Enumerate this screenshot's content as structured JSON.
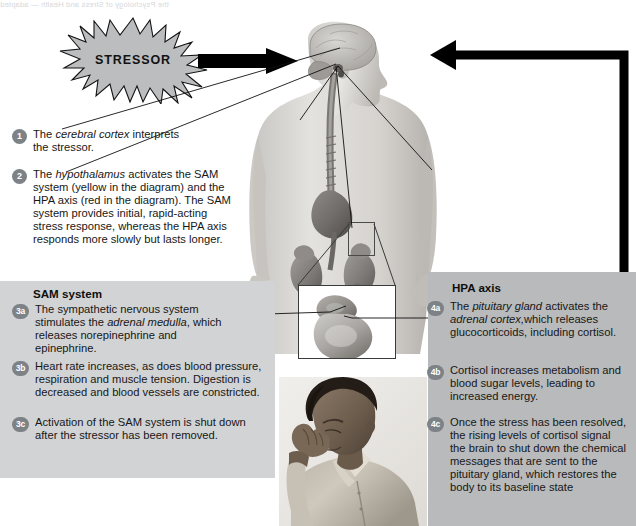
{
  "page": {
    "bleed_text": "the Psychology of Stress and Health — adapted",
    "width": 636,
    "height": 526,
    "background": "#ffffff"
  },
  "colors": {
    "badge": "#7d8287",
    "sam_panel": "#d2d3d4",
    "hpa_panel": "#b9babb",
    "burst_fill": "#bcbdbe",
    "arrow": "#000000",
    "text": "#171717"
  },
  "stressor": {
    "label": "STRESSOR",
    "shape": "starburst"
  },
  "steps": [
    {
      "id": "1",
      "badge": "1",
      "text_parts": [
        {
          "t": "The ",
          "i": false
        },
        {
          "t": "cerebral cortex",
          "i": true
        },
        {
          "t": " interprets the stressor.",
          "i": false
        }
      ]
    },
    {
      "id": "2",
      "badge": "2",
      "text_parts": [
        {
          "t": "The ",
          "i": false
        },
        {
          "t": "hypothalamus",
          "i": true
        },
        {
          "t": " activates the SAM system (yellow in the diagram) and the HPA axis (red in the diagram). The SAM system provides initial, rapid-acting stress response, whereas the HPA axis responds more slowly but lasts longer.",
          "i": false
        }
      ]
    }
  ],
  "sam": {
    "heading": "SAM system",
    "steps": [
      {
        "id": "3a",
        "badge": "3a",
        "text_parts": [
          {
            "t": "The sympathetic nervous system stimulates the ",
            "i": false
          },
          {
            "t": "adrenal medulla",
            "i": true
          },
          {
            "t": ", which releases norepinephrine and epinephrine.",
            "i": false
          }
        ]
      },
      {
        "id": "3b",
        "badge": "3b",
        "text_parts": [
          {
            "t": "Heart rate increases, as does blood pressure, respiration and muscle tension. Digestion is decreased and blood vessels are constricted.",
            "i": false
          }
        ]
      },
      {
        "id": "3c",
        "badge": "3c",
        "text_parts": [
          {
            "t": "Activation of the SAM system is shut down after the stressor has been removed.",
            "i": false
          }
        ]
      }
    ]
  },
  "hpa": {
    "heading": "HPA axis",
    "steps": [
      {
        "id": "4a",
        "badge": "4a",
        "text_parts": [
          {
            "t": "The ",
            "i": false
          },
          {
            "t": "pituitary gland",
            "i": true
          },
          {
            "t": " activates the ",
            "i": false
          },
          {
            "t": "adrenal cortex,",
            "i": true
          },
          {
            "t": "which releases glucocorticoids, including cortisol.",
            "i": false
          }
        ]
      },
      {
        "id": "4b",
        "badge": "4b",
        "text_parts": [
          {
            "t": "Cortisol increases metabolism and blood sugar levels, leading to increased energy.",
            "i": false
          }
        ]
      },
      {
        "id": "4c",
        "badge": "4c",
        "text_parts": [
          {
            "t": "Once the stress has been resolved, the rising levels of cortisol signal the brain to shut down the chemical messages that are sent to the pituitary gland, which restores the body to its baseline state",
            "i": false
          }
        ]
      }
    ]
  },
  "illustration": {
    "figure_alt": "anatomical torso with brain, spinal cord, kidneys and adrenal glands",
    "inset_alt": "magnified adrenal gland on kidney",
    "photo_alt": "stressed man with hand on forehead"
  }
}
